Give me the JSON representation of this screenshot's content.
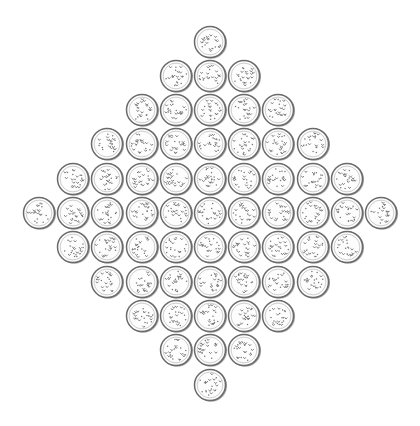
{
  "canvas": {
    "width": 420,
    "height": 426,
    "background": "#ffffff"
  },
  "pattern": {
    "name": "diamond-arrangement-of-textured-discs",
    "rows": [
      1,
      3,
      5,
      7,
      9,
      11,
      9,
      7,
      5,
      3,
      1
    ],
    "total_items": 61,
    "center": {
      "x": 210,
      "y": 213
    },
    "spacing": {
      "x": 34.2,
      "y": 34.3
    },
    "radius": 15.5
  },
  "style": {
    "outline_color": "#6a6a6a",
    "inner_ring_color": "#8a8a8a",
    "fill_color": "#fdfdfd",
    "speckle_color": "#777777",
    "shadow_color": "#d9d9d9"
  }
}
